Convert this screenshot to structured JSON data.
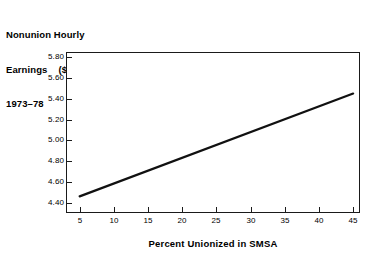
{
  "chart_data": {
    "type": "line",
    "title": "Nonunion Hourly Earnings  ($) 1973–78",
    "title_lines": [
      "Nonunion Hourly",
      "Earnings    ($)",
      "1973–78"
    ],
    "xlabel": "Percent Unionized in SMSA",
    "ylabel": "Nonunion Hourly Earnings ($)",
    "xlim": [
      3,
      46
    ],
    "ylim": [
      4.3,
      5.85
    ],
    "xticks": [
      5,
      10,
      15,
      20,
      25,
      30,
      35,
      40,
      45
    ],
    "xtick_labels": [
      "5",
      "10",
      "15",
      "20",
      "25",
      "30",
      "35",
      "40",
      "45"
    ],
    "yticks": [
      4.4,
      4.6,
      4.8,
      5.0,
      5.2,
      5.4,
      5.6,
      5.8
    ],
    "ytick_labels": [
      "4.40",
      "4.60",
      "4.80",
      "5.00",
      "5.20",
      "5.40",
      "5.60",
      "5.80"
    ],
    "grid": false,
    "legend": false,
    "series": [
      {
        "name": "Nonunion hourly earnings",
        "color": "#111111",
        "x": [
          5,
          45
        ],
        "values": [
          4.46,
          5.45
        ]
      }
    ]
  },
  "colors": {
    "line": "#111111",
    "axis": "#1a1a1a",
    "background": "#ffffff",
    "text": "#000000"
  }
}
